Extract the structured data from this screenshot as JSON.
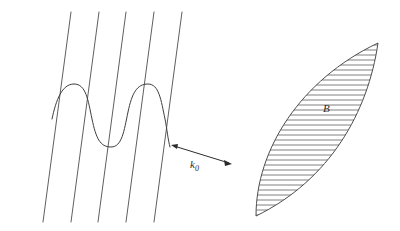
{
  "figure": {
    "background_color": "#ffffff",
    "line_color": "#4d4d4d",
    "wave_color": "#3d3d3d",
    "arrow_color": "#2b2b2b",
    "hatch_color": "#555555",
    "width": 400,
    "height": 231
  },
  "wavefronts": {
    "name": "parallel-wavefront-lines",
    "count": 5,
    "description": "five parallel straight lines inclined from lower-left to upper-right",
    "slope_dx": -28,
    "slope_dy": 210,
    "top_y": 12,
    "bottom_y": 222,
    "top_x_positions": [
      71,
      99,
      126,
      154,
      182
    ],
    "bottom_x_positions": [
      43,
      71,
      98,
      126,
      154
    ]
  },
  "wave": {
    "name": "sinusoidal-wave",
    "cycles": 2,
    "amplitude": 26,
    "start": {
      "x": 52,
      "y": 119
    },
    "end": {
      "x": 170,
      "y": 147
    },
    "description": "sinusoidal oscillation superimposed across the wavefront lines, oscillating perpendicular to the line direction"
  },
  "arrow": {
    "name": "wave-vector-arrow",
    "label": "k",
    "subscript": "0",
    "label_full": "k₀",
    "double_headed": true,
    "start": {
      "x": 172,
      "y": 145
    },
    "end": {
      "x": 231,
      "y": 164
    },
    "label_position": {
      "x": 192,
      "y": 166
    }
  },
  "region": {
    "name": "hatched-lens-region",
    "label": "B",
    "label_position": {
      "x": 327,
      "y": 108
    },
    "hatch_orientation": "horizontal",
    "hatch_spacing": 5.4,
    "hatch_count": 31,
    "tip_top": {
      "x": 378,
      "y": 43
    },
    "tip_bottom": {
      "x": 256,
      "y": 216
    },
    "description": "leaf / lens shaped closed region filled with horizontal hatch lines, oriented diagonally from lower-left to upper-right"
  }
}
